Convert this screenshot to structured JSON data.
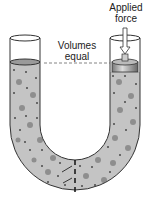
{
  "labels": {
    "force_line1": "Applied",
    "force_line2": "force",
    "volumes_line1": "Volumes",
    "volumes_line2": "equal"
  },
  "colors": {
    "fluid": "#c4c4c4",
    "particles_large": "#8e8e8e",
    "particles_small": "#4a4a4a",
    "outline": "#333333",
    "piston": "#9a9a9a"
  }
}
